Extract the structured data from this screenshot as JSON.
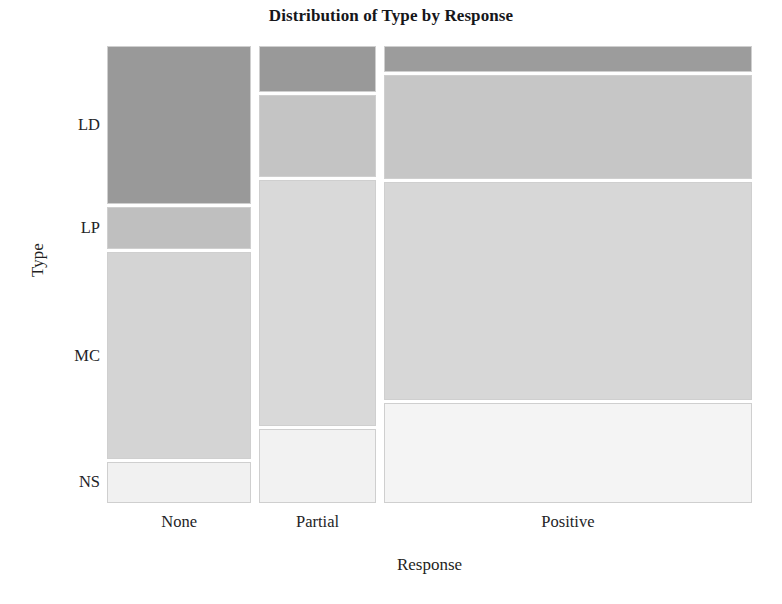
{
  "chart_data": {
    "type": "mosaic",
    "title": "Distribution of Type by Response",
    "xlabel": "Response",
    "ylabel": "Type",
    "categories_x": [
      "None",
      "Partial",
      "Positive"
    ],
    "categories_y": [
      "LD",
      "LP",
      "MC",
      "NS"
    ],
    "grid": false,
    "legend": "none",
    "column_widths_px": [
      145,
      117,
      370
    ],
    "column_width_fractions": [
      0.2294,
      0.1851,
      0.5855
    ],
    "cells": [
      {
        "x": "None",
        "segments": [
          {
            "y": "LD",
            "height_px": 158,
            "fraction": 0.3458,
            "color": "#999999"
          },
          {
            "y": "LP",
            "height_px": 42,
            "fraction": 0.0919,
            "color": "#bfbfbf"
          },
          {
            "y": "MC",
            "height_px": 206,
            "fraction": 0.4508,
            "color": "#d4d4d4"
          },
          {
            "y": "NS",
            "height_px": 41,
            "fraction": 0.0897,
            "color": "#f1f1f1"
          }
        ]
      },
      {
        "x": "Partial",
        "segments": [
          {
            "y": "LD",
            "height_px": 46,
            "fraction": 0.1007,
            "color": "#999999"
          },
          {
            "y": "LP",
            "height_px": 81,
            "fraction": 0.1773,
            "color": "#c4c4c4"
          },
          {
            "y": "MC",
            "height_px": 244,
            "fraction": 0.5339,
            "color": "#d9d9d9"
          },
          {
            "y": "NS",
            "height_px": 73,
            "fraction": 0.1598,
            "color": "#f2f2f2"
          }
        ]
      },
      {
        "x": "Positive",
        "segments": [
          {
            "y": "LD",
            "height_px": 26,
            "fraction": 0.0569,
            "color": "#9c9c9c"
          },
          {
            "y": "LP",
            "height_px": 103,
            "fraction": 0.2254,
            "color": "#c6c6c6"
          },
          {
            "y": "MC",
            "height_px": 217,
            "fraction": 0.4748,
            "color": "#d7d7d7"
          },
          {
            "y": "NS",
            "height_px": 99,
            "fraction": 0.2166,
            "color": "#f4f4f4"
          }
        ]
      }
    ],
    "tile_border_color": "#cfcfcf",
    "background": "#ffffff"
  }
}
